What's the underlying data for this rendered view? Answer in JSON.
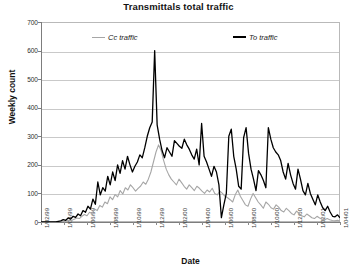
{
  "chart_data": {
    "type": "line",
    "title": "Transmittals total traffic",
    "xlabel": "Date",
    "ylabel": "Weekly count",
    "ylim": [
      0,
      700
    ],
    "ytick_step": 100,
    "yticks": [
      0,
      100,
      200,
      300,
      400,
      500,
      600,
      700
    ],
    "grid": true,
    "legend_position": "top-inside",
    "xticks": [
      "1/02/99",
      "1/04/99",
      "1/06/99",
      "1/08/99",
      "1/10/99",
      "1/12/99",
      "1/02/00",
      "1/04/00",
      "1/06/00",
      "1/08/00",
      "1/10/00",
      "1/12/00",
      "1/02/01",
      "1/04/01"
    ],
    "x_start": "1/02/99",
    "x_end": "1/04/01",
    "x_interval": "weekly",
    "n_points": 118,
    "series": [
      {
        "name": "Cc traffic",
        "color": "#a6a6a6",
        "values": [
          0,
          0,
          0,
          0,
          0,
          0,
          0,
          0,
          0,
          2,
          4,
          6,
          5,
          10,
          14,
          12,
          20,
          26,
          22,
          34,
          30,
          45,
          40,
          58,
          52,
          70,
          64,
          88,
          78,
          96,
          88,
          110,
          98,
          120,
          112,
          130,
          120,
          108,
          118,
          126,
          140,
          132,
          150,
          175,
          210,
          245,
          270,
          250,
          215,
          185,
          165,
          150,
          140,
          130,
          150,
          138,
          125,
          115,
          130,
          120,
          110,
          125,
          118,
          108,
          100,
          112,
          105,
          118,
          100,
          95,
          108,
          100,
          90,
          85,
          78,
          70,
          95,
          112,
          90,
          75,
          60,
          55,
          80,
          100,
          85,
          70,
          60,
          48,
          70,
          62,
          50,
          45,
          60,
          52,
          40,
          35,
          48,
          40,
          30,
          25,
          38,
          30,
          22,
          18,
          28,
          22,
          15,
          12,
          20,
          14,
          10,
          8,
          12,
          8,
          5,
          4,
          6,
          3
        ]
      },
      {
        "name": "To traffic",
        "color": "#000000",
        "values": [
          0,
          0,
          0,
          0,
          0,
          0,
          0,
          2,
          4,
          8,
          6,
          14,
          10,
          20,
          16,
          28,
          22,
          40,
          34,
          55,
          45,
          80,
          62,
          140,
          95,
          120,
          108,
          160,
          130,
          175,
          145,
          200,
          170,
          215,
          185,
          230,
          200,
          175,
          195,
          210,
          235,
          225,
          260,
          300,
          330,
          350,
          600,
          340,
          290,
          250,
          225,
          260,
          245,
          230,
          285,
          275,
          265,
          258,
          290,
          270,
          255,
          235,
          220,
          255,
          200,
          345,
          230,
          210,
          185,
          160,
          195,
          175,
          130,
          15,
          60,
          100,
          300,
          325,
          230,
          185,
          125,
          115,
          295,
          330,
          240,
          185,
          150,
          110,
          180,
          165,
          145,
          120,
          330,
          290,
          260,
          245,
          235,
          215,
          175,
          150,
          205,
          165,
          135,
          115,
          185,
          150,
          110,
          95,
          135,
          100,
          80,
          60,
          95,
          70,
          50,
          40,
          55,
          35,
          20,
          18,
          25,
          15
        ]
      }
    ]
  },
  "legend": {
    "cc_label": "Cc traffic",
    "to_label": "To traffic"
  }
}
